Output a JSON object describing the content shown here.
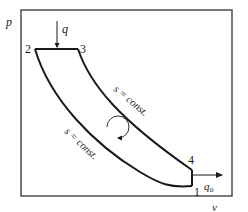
{
  "diagram": {
    "type": "p-v thermodynamic cycle",
    "axes": {
      "y_label": "p",
      "x_label": "v"
    },
    "points": [
      {
        "id": "1",
        "label": "1"
      },
      {
        "id": "2",
        "label": "2"
      },
      {
        "id": "3",
        "label": "3"
      },
      {
        "id": "4",
        "label": "4"
      }
    ],
    "heat_in": {
      "label": "q"
    },
    "heat_out": {
      "label": "q",
      "subscript": "o"
    },
    "isentropes": [
      {
        "label": "s = const.",
        "between": "3-4"
      },
      {
        "label": "s = const.",
        "between": "1-2"
      }
    ],
    "cycle_direction": "clockwise",
    "colors": {
      "line": "#1a1a1a",
      "frame": "#333333",
      "background": "#ffffff"
    }
  }
}
